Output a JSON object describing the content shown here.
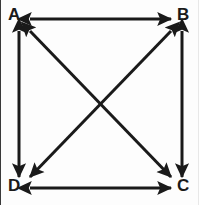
{
  "diagram": {
    "type": "directed-graph",
    "stroke_color": "#1a1a1a",
    "background_color": "#fdfdfd",
    "stroke_width": 3,
    "vertices": [
      {
        "id": "A",
        "label": "A",
        "x": 18,
        "y": 19,
        "corner": "top-left"
      },
      {
        "id": "B",
        "label": "B",
        "x": 181,
        "y": 19,
        "corner": "top-right"
      },
      {
        "id": "C",
        "label": "C",
        "x": 181,
        "y": 188,
        "corner": "bottom-right"
      },
      {
        "id": "D",
        "label": "D",
        "x": 18,
        "y": 188,
        "corner": "bottom-left"
      }
    ],
    "edges": [
      {
        "id": "edge-ab",
        "from": "A",
        "to": "B",
        "kind": "bidirectional",
        "orientation": "horizontal"
      },
      {
        "id": "edge-dc",
        "from": "D",
        "to": "C",
        "kind": "bidirectional",
        "orientation": "horizontal"
      },
      {
        "id": "edge-ad",
        "from": "A",
        "to": "D",
        "kind": "bidirectional",
        "orientation": "vertical"
      },
      {
        "id": "edge-bc",
        "from": "B",
        "to": "C",
        "kind": "bidirectional",
        "orientation": "vertical"
      },
      {
        "id": "edge-ac",
        "from": "A",
        "to": "C",
        "kind": "bidirectional",
        "orientation": "diagonal"
      },
      {
        "id": "edge-bd",
        "from": "B",
        "to": "D",
        "kind": "bidirectional",
        "orientation": "diagonal"
      }
    ],
    "edge_count": 6,
    "vertex_count": 4
  }
}
